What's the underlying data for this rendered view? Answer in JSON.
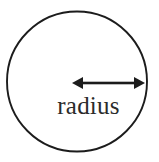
{
  "figure": {
    "kind": "geometry-diagram",
    "background_color": "#ffffff",
    "stroke_color": "#1c1c1c",
    "label_color": "#2b2b2b",
    "width": 159,
    "height": 162
  },
  "circle": {
    "name": "circle-outline",
    "center_x": 77,
    "center_y": 81.5,
    "radius": 70,
    "stroke_width": 1.9,
    "fill": "none"
  },
  "arrow": {
    "name": "radius-arrow",
    "style": "double-headed",
    "start_x": 72,
    "end_x": 145,
    "y": 83,
    "shaft_width": 2.6,
    "head_length": 11,
    "head_half_height": 6
  },
  "labels": {
    "radius": "radius"
  }
}
